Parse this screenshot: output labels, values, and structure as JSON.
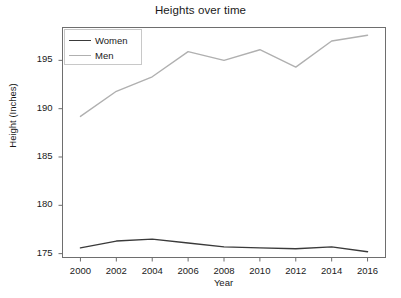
{
  "chart_data": {
    "type": "line",
    "title": "Heights over time",
    "xlabel": "Year",
    "ylabel": "Height (Inches)",
    "x": [
      2000,
      2002,
      2004,
      2006,
      2008,
      2010,
      2012,
      2014,
      2016
    ],
    "xtick_labels": [
      "2000",
      "2002",
      "2004",
      "2006",
      "2008",
      "2010",
      "2012",
      "2014",
      "2016"
    ],
    "ytick_labels": [
      "175",
      "180",
      "185",
      "190",
      "195"
    ],
    "yticks": [
      175,
      180,
      185,
      190,
      195
    ],
    "xlim": [
      1999,
      2017
    ],
    "ylim": [
      174.6,
      198.4
    ],
    "grid": false,
    "legend_position": "upper-left",
    "series": [
      {
        "name": "Women",
        "color": "#3a3a3a",
        "values": [
          175.6,
          176.3,
          176.5,
          176.1,
          175.7,
          175.6,
          175.5,
          175.7,
          175.2
        ]
      },
      {
        "name": "Men",
        "color": "#b0b0b0",
        "values": [
          189.2,
          191.8,
          193.3,
          195.9,
          195.0,
          196.1,
          194.3,
          197.0,
          197.6
        ]
      }
    ]
  },
  "axes": {
    "frame_color": "#6e6e6e",
    "tick_color": "#6e6e6e"
  }
}
